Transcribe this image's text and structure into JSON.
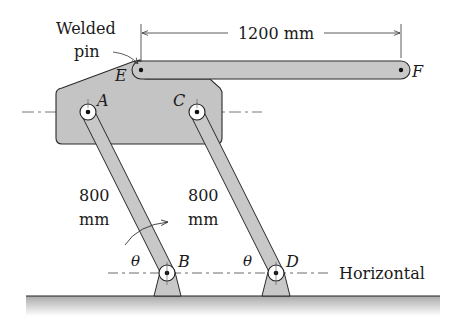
{
  "figure": {
    "type": "mechanism"
  },
  "labels": {
    "welded_line1": "Welded",
    "welded_line2": "pin",
    "dimension_EF": "1200 mm",
    "link_AB_len_1": "800",
    "link_AB_len_2": "mm",
    "link_CD_len_1": "800",
    "link_CD_len_2": "mm",
    "horizontal": "Horizontal",
    "theta_B": "θ",
    "theta_D": "θ"
  },
  "points": {
    "A": "A",
    "B": "B",
    "C": "C",
    "D": "D",
    "E": "E",
    "F": "F"
  },
  "colors": {
    "member_fill": "#c8c8c8",
    "plate_fill": "#c4c4c4",
    "stroke": "#2a2a2a",
    "ground_shade": "#bdbdbd",
    "background": "#ffffff"
  }
}
